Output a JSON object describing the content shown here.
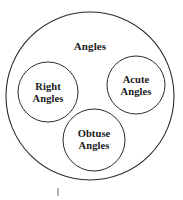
{
  "diagram": {
    "type": "euler-diagram",
    "title": "Angles",
    "background_color": "#ffffff",
    "stroke_color": "#2b2b2b",
    "text_color": "#1a1a1a",
    "universe": {
      "label": "Angles",
      "cx": 90,
      "cy": 96,
      "r": 84
    },
    "subsets": [
      {
        "name": "right-angles",
        "label": "Right\nAngles",
        "label_line1": "Right",
        "label_line2": "Angles",
        "cx": 48,
        "cy": 92,
        "r": 30
      },
      {
        "name": "acute-angles",
        "label": "Acute\nAngles",
        "label_line1": "Acute",
        "label_line2": "Angles",
        "cx": 136,
        "cy": 85,
        "r": 29
      },
      {
        "name": "obtuse-angles",
        "label": "Obtuse\nAngles",
        "label_line1": "Obtuse",
        "label_line2": "Angles",
        "cx": 94,
        "cy": 140,
        "r": 31
      }
    ],
    "tick_mark": {
      "x": 58,
      "y1": 188,
      "y2": 196,
      "color": "#6b6b6b"
    }
  }
}
